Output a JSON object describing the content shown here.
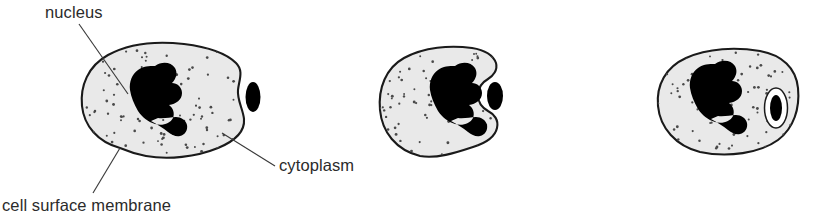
{
  "figure": {
    "background_color": "#ffffff",
    "width": 818,
    "height": 216
  },
  "labels": [
    {
      "key": "nucleus",
      "text": "nucleus",
      "x": 45,
      "y": 18,
      "anchor": "start",
      "leader": "M 79 24 L 128 94"
    },
    {
      "key": "cytoplasm",
      "text": "cytoplasm",
      "x": 279,
      "y": 171,
      "anchor": "start",
      "leader": "M 275 166 L 222 133"
    },
    {
      "key": "cell_surface_membrane",
      "text": "cell surface membrane",
      "x": 2,
      "y": 211,
      "anchor": "start",
      "leader": "M 93 193 L 120 148"
    }
  ],
  "colors": {
    "cytoplasm_fill": "#e9e9e9",
    "membrane_stroke": "#1a1a1a",
    "nucleus_fill": "#000000",
    "bacterium_fill": "#000000",
    "vacuole_fill": "#ffffff",
    "stipple": "#4a4a4a",
    "text": "#2b2b2b",
    "leader": "#3a3a3a"
  },
  "stages": [
    {
      "key": "stage-1-bacterium-outside",
      "caption": "",
      "cell_outline": "M 120 148 C 98 142 84 126 82 106 C 80 86 88 66 108 55 C 130 43 158 41 184 44 C 208 47 226 53 236 63 C 244 71 239 80 238 90 C 237 100 243 109 244 119 C 245 131 235 141 218 148 C 196 157 168 160 146 156 C 136 154 127 151 120 148 Z",
      "nucleus_path": "M 155 66 C 162 61 171 62 175 68 C 178 73 176 79 172 83 C 177 83 182 87 182 93 C 182 100 176 104 169 105 C 173 108 175 113 173 118 C 170 124 162 126 155 124 C 148 122 142 117 138 111 C 134 104 131 97 130 90 C 129 82 132 74 138 70 C 143 66 149 66 155 66 Z M 151 121 C 157 124 163 128 168 132 C 172 135 176 137 180 136 C 185 135 188 130 187 125 C 186 120 181 117 176 117 C 170 117 164 119 158 118 Z",
      "bacterium": {
        "type": "free-oval",
        "cx": 253,
        "cy": 97,
        "rx": 7.5,
        "ry": 15
      },
      "vacuole": null
    },
    {
      "key": "stage-2-engulfing-pseudopodia",
      "caption": "",
      "cell_outline": "M 420 156 C 396 150 382 132 380 110 C 378 88 386 68 404 58 C 424 47 450 45 472 48 C 485 50 493 55 496 63 C 498 70 493 76 488 79 C 481 83 478 88 478 95 C 478 102 481 107 488 111 C 494 114 499 120 497 128 C 495 137 486 143 473 147 C 455 153 436 159 420 156 Z",
      "nucleus_path": "M 455 66 C 462 61 471 62 475 68 C 478 73 476 79 472 83 C 477 83 482 87 482 93 C 482 100 476 104 469 105 C 473 108 475 113 473 118 C 470 124 462 126 455 124 C 448 122 442 117 438 111 C 434 104 431 97 430 90 C 429 82 432 74 438 70 C 443 66 449 66 455 66 Z M 451 121 C 457 124 463 128 468 132 C 472 135 476 137 480 136 C 485 135 488 130 487 125 C 486 120 481 117 476 117 C 470 117 464 119 458 118 Z",
      "bacterium": {
        "type": "free-oval",
        "cx": 495,
        "cy": 96,
        "rx": 8,
        "ry": 14
      },
      "vacuole": null
    },
    {
      "key": "stage-3-bacterium-in-vacuole",
      "caption": "",
      "cell_outline": "M 700 152 C 676 146 660 128 658 106 C 656 85 666 67 686 58 C 708 48 736 47 760 51 C 782 55 796 68 798 88 C 800 108 794 128 778 140 C 760 153 728 158 700 152 Z",
      "nucleus_path": "M 715 64 C 722 59 731 60 735 66 C 738 71 736 77 732 81 C 737 81 742 85 742 91 C 742 98 736 102 729 103 C 733 106 735 111 733 116 C 730 122 722 124 715 122 C 708 120 702 115 698 109 C 694 102 691 95 690 88 C 689 80 692 72 698 68 C 703 64 709 64 715 64 Z M 711 119 C 717 122 723 126 728 130 C 732 133 736 135 740 134 C 745 133 748 128 747 123 C 746 118 741 115 736 115 C 730 115 724 117 718 116 Z",
      "bacterium": {
        "type": "enclosed-oval",
        "cx": 776,
        "cy": 108,
        "rx": 6,
        "ry": 13
      },
      "vacuole": {
        "cx": 776,
        "cy": 108,
        "rx": 11.5,
        "ry": 20
      }
    }
  ]
}
